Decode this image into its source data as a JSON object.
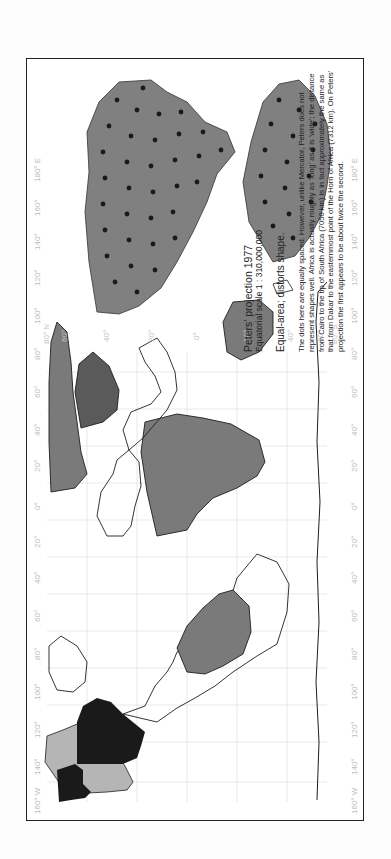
{
  "figure": {
    "title": "Peters' projection 1977",
    "scale": "Equatorial scale 1 : 310,000,000",
    "property": "Equal-area; distorts shape.",
    "description": "The dots here are equally spaced. However, unlike Mercator, Peters does not represent shapes well. Africa is actually roughly as 'long' as it is 'wide'; the distance from Cairo to the tip of South Africa (7050 km) is in fact approximately the same as that from Dakar to the easternmost point of the Horn of Africa (7312 km). On Peters' projection the first appears to be about twice the second."
  },
  "map": {
    "longitude_labels_top": [
      "160° W",
      "140°",
      "120°",
      "100°",
      "80°",
      "60°",
      "40°",
      "20°",
      "0°",
      "20°",
      "40°",
      "60°",
      "80°",
      "100°",
      "120°",
      "140°",
      "160°",
      "180° E"
    ],
    "longitude_labels_bottom": [
      "160° W",
      "140°",
      "120°",
      "100°",
      "80°",
      "60°",
      "40°",
      "20°",
      "0°",
      "20°",
      "40°",
      "60°",
      "80°",
      "100°",
      "120°",
      "140°",
      "160°",
      "180° E"
    ],
    "latitude_labels": [
      "80° N",
      "60°",
      "40°",
      "20°",
      "0°",
      "20°",
      "40°",
      "60°",
      "80° S"
    ],
    "colors": {
      "land_grey": "#7a7a7a",
      "asia_dark": "#5a5a5a",
      "north_america_light": "#b5b5b5",
      "north_america_black": "#1a1a1a",
      "outline": "#1e1e1e",
      "grid": "#e2e2e2"
    }
  },
  "inset": {
    "description": "Africa and South America with equally spaced dots",
    "dot_color": "#1a1a1a",
    "land_color": "#808080"
  }
}
